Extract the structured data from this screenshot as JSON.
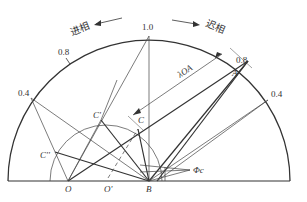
{
  "diagram": {
    "title": "",
    "directions": {
      "leading": {
        "label": "进相",
        "arrow": "left"
      },
      "lagging": {
        "label": "迟相",
        "arrow": "right"
      }
    },
    "pf_scale": {
      "top": "1.0",
      "left_08": "0.8",
      "right_08": "0.8",
      "left_04": "0.4",
      "right_04": "0.4"
    },
    "points": {
      "O": "O",
      "O_prime": "O'",
      "B": "B",
      "A": "A",
      "C": "C",
      "C_prime": "C'",
      "C_dprime": "C''",
      "phi_c": "Φc"
    },
    "vector_label": "λOA",
    "colors": {
      "line": "#333333",
      "background": "#ffffff"
    }
  }
}
